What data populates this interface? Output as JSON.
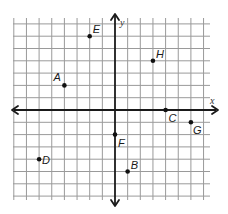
{
  "diagram": {
    "type": "coordinate-plane",
    "axes": {
      "x_label": "x",
      "y_label": "y"
    },
    "grid": {
      "x_min": -8,
      "x_max": 7,
      "y_min": -7,
      "y_max": 7
    },
    "colors": {
      "grid": "#9a9a9a",
      "axis": "#1a1a1a",
      "point": "#111111",
      "background": "#ffffff"
    },
    "points": [
      {
        "label": "A",
        "x": -4,
        "y": 2
      },
      {
        "label": "B",
        "x": 1,
        "y": -5
      },
      {
        "label": "C",
        "x": 4,
        "y": 0
      },
      {
        "label": "D",
        "x": -6,
        "y": -4
      },
      {
        "label": "E",
        "x": -2,
        "y": 6
      },
      {
        "label": "F",
        "x": 0,
        "y": -2
      },
      {
        "label": "G",
        "x": 6,
        "y": -1
      },
      {
        "label": "H",
        "x": 3,
        "y": 4
      }
    ]
  }
}
